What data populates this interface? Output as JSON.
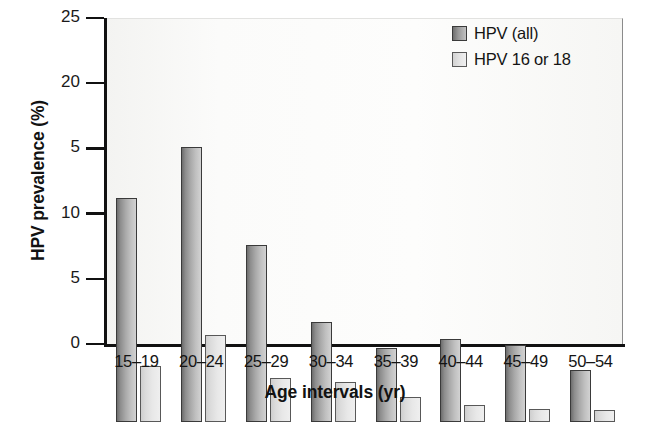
{
  "chart_data": {
    "type": "bar",
    "title": "",
    "xlabel": "Age intervals (yr)",
    "ylabel": "HPV prevalence (%)",
    "categories": [
      "15–19",
      "20–24",
      "25–29",
      "30–34",
      "35–39",
      "40–44",
      "45–49",
      "50–54"
    ],
    "series": [
      {
        "name": "HPV (all)",
        "color": "#8d8d8d",
        "values": [
          17.2,
          21.1,
          13.6,
          7.7,
          5.7,
          6.4,
          5.9,
          4.0
        ]
      },
      {
        "name": "HPV 16 or 18",
        "color": "#e0e0e0",
        "values": [
          4.3,
          6.7,
          3.4,
          3.1,
          1.9,
          1.3,
          1.0,
          0.9
        ]
      }
    ],
    "ylim": [
      0,
      25
    ],
    "ytick_values": [
      25,
      20,
      15,
      10,
      5,
      0
    ],
    "ytick_labels": [
      "25",
      "20",
      "5",
      "10",
      "5",
      "0"
    ],
    "grid": false,
    "legend_position": "top-right"
  },
  "legend": {
    "entries": [
      {
        "label": "HPV (all)",
        "swatch": "dark-gradient-swatch"
      },
      {
        "label": "HPV 16 or 18",
        "swatch": "light-gradient-swatch"
      }
    ]
  }
}
